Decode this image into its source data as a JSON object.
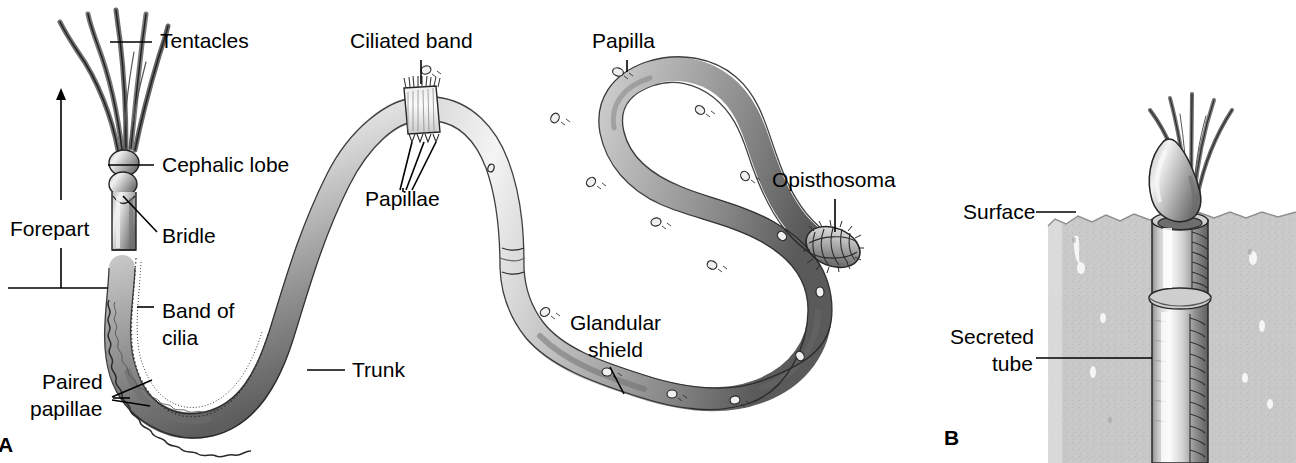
{
  "figure": {
    "kind": "anatomical-diagram",
    "background_color": "#ffffff",
    "ink_color": "#000000"
  },
  "panels": [
    {
      "id": "A",
      "label": "A",
      "caption_position": "bottom-left",
      "description": "Whole animal, body drawn in a long S-curve"
    },
    {
      "id": "B",
      "label": "B",
      "caption_position": "bottom-left",
      "description": "Animal emerging from its secreted tube buried in sediment"
    }
  ],
  "panel_a": {
    "labels": [
      {
        "key": "tentacles",
        "text": "Tentacles",
        "x": 160,
        "y": 48,
        "anchor": "start"
      },
      {
        "key": "cephalic_lobe",
        "text": "Cephalic lobe",
        "x": 162,
        "y": 170,
        "anchor": "start"
      },
      {
        "key": "bridle",
        "text": "Bridle",
        "x": 162,
        "y": 243,
        "anchor": "start"
      },
      {
        "key": "forepart",
        "text": "Forepart",
        "x": 10,
        "y": 236,
        "anchor": "start"
      },
      {
        "key": "band_of_cilia",
        "text": "Band of",
        "x": 162,
        "y": 318,
        "anchor": "start"
      },
      {
        "key": "band_of_cilia2",
        "text": "cilia",
        "x": 162,
        "y": 345,
        "anchor": "start"
      },
      {
        "key": "paired_pap",
        "text": "Paired",
        "x": 42,
        "y": 389,
        "anchor": "start"
      },
      {
        "key": "paired_pap2",
        "text": "papillae",
        "x": 30,
        "y": 416,
        "anchor": "start"
      },
      {
        "key": "trunk",
        "text": "Trunk",
        "x": 352,
        "y": 377,
        "anchor": "start"
      },
      {
        "key": "ciliated_band",
        "text": "Ciliated band",
        "x": 350,
        "y": 48,
        "anchor": "start"
      },
      {
        "key": "papillae",
        "text": "Papillae",
        "x": 365,
        "y": 206,
        "anchor": "start"
      },
      {
        "key": "papilla",
        "text": "Papilla",
        "x": 592,
        "y": 48,
        "anchor": "start"
      },
      {
        "key": "opisthosoma",
        "text": "Opisthosoma",
        "x": 772,
        "y": 187,
        "anchor": "start"
      },
      {
        "key": "glandular",
        "text": "Glandular",
        "x": 570,
        "y": 330,
        "anchor": "start"
      },
      {
        "key": "glandular2",
        "text": "shield",
        "x": 588,
        "y": 357,
        "anchor": "start"
      }
    ],
    "structure_notes": {
      "tentacle_count": 5,
      "body_shape": "S-curve: descending hook at left, large left loop, right loop, tail to lower right then up to tail tip",
      "opisthosoma_shape": "segmented ovoid with bristles",
      "papilla_markers": 16
    }
  },
  "panel_b": {
    "labels": [
      {
        "key": "surface",
        "text": "Surface",
        "x": 963,
        "y": 218,
        "anchor": "start"
      },
      {
        "key": "secreted_tube",
        "text": "Secreted",
        "x": 950,
        "y": 344,
        "anchor": "start"
      },
      {
        "key": "secreted_tube2",
        "text": "tube",
        "x": 992,
        "y": 371,
        "anchor": "start"
      }
    ],
    "sediment": {
      "fill": "#c9c9c9",
      "left": 1048,
      "right": 1296,
      "top": 212,
      "bottom": 463
    },
    "tube": {
      "fill_light": "#f2f2f2",
      "fill_mid": "#b5b5b5",
      "fill_dark": "#6a6a6a"
    }
  },
  "palette": {
    "body_highlight": "#f4f4f4",
    "body_mid": "#a9a9a9",
    "body_shadow": "#585858",
    "outline": "#1a1a1a",
    "sediment": "#c9c9c9",
    "paper": "#ffffff"
  }
}
